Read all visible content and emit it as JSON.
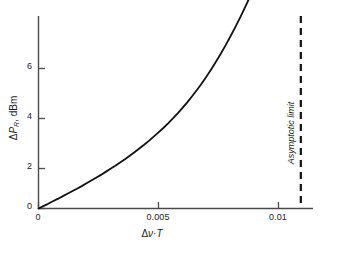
{
  "chart_data": {
    "type": "line",
    "title": "",
    "subtitle": "",
    "xlabel_parts": {
      "delta": "Δ",
      "nu": "ν",
      "dot": "·",
      "t": "T"
    },
    "xlabel": "Δν·T",
    "ylabel_parts": {
      "delta": "Δ",
      "p": "P",
      "sub": "R",
      "rest": ", dBm"
    },
    "ylabel": "ΔP_R, dBm",
    "xlim": [
      0,
      0.01146
    ],
    "ylim": [
      0,
      7.68
    ],
    "xticks": [
      0,
      0.005,
      0.01
    ],
    "xtick_labels": [
      "0",
      "0.005",
      "0.01"
    ],
    "yticks": [
      0,
      2,
      4,
      6
    ],
    "ytick_labels": [
      "0",
      "2",
      "4",
      "6"
    ],
    "grid": false,
    "legend": false,
    "series": [
      {
        "name": "Power penalty",
        "color": "#111111",
        "linewidth": 1.8,
        "x": [
          0.0,
          0.0002,
          0.0004,
          0.0006,
          0.0008,
          0.001,
          0.0012,
          0.0014,
          0.0016,
          0.0018,
          0.002,
          0.0022,
          0.0024,
          0.0026,
          0.0028,
          0.003,
          0.0032,
          0.0034,
          0.0036,
          0.0038,
          0.004,
          0.0042,
          0.0044,
          0.0046,
          0.0048,
          0.005,
          0.0052,
          0.0054,
          0.0056,
          0.0058,
          0.006,
          0.0062,
          0.0064,
          0.0066,
          0.0068,
          0.007,
          0.0072,
          0.0074,
          0.0076,
          0.0078,
          0.008,
          0.0082,
          0.0084,
          0.0086,
          0.0088
        ],
        "y": [
          0.0,
          0.1,
          0.2,
          0.31,
          0.41,
          0.52,
          0.63,
          0.74,
          0.85,
          0.96,
          1.08,
          1.2,
          1.32,
          1.44,
          1.57,
          1.7,
          1.83,
          1.97,
          2.11,
          2.26,
          2.41,
          2.57,
          2.73,
          2.9,
          3.08,
          3.26,
          3.45,
          3.65,
          3.86,
          4.08,
          4.31,
          4.55,
          4.81,
          5.08,
          5.36,
          5.66,
          5.97,
          6.3,
          6.64,
          7.0,
          7.38,
          7.77,
          8.18,
          8.61,
          9.05
        ]
      }
    ],
    "annotations": [
      {
        "name": "asymptotic-limit",
        "text": "Asymptotic limit",
        "type": "vline",
        "x": 0.01093,
        "style": "dashed",
        "color": "#111111",
        "linewidth": 2.2
      }
    ],
    "curve_visible_end": {
      "x": 0.00885,
      "y": 6.72
    },
    "axis_color": "#444444"
  },
  "figure": {
    "background": "#ffffff"
  }
}
